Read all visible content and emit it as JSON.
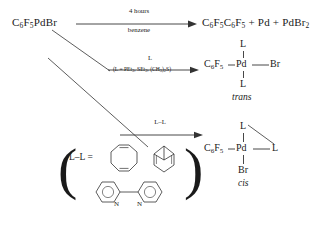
{
  "scheme": {
    "title": "Reactions of pentafluorophenylpalladium bromide",
    "reactant": {
      "label": "C6F5PdBr",
      "parts": [
        {
          "t": "C",
          "sub": ""
        },
        {
          "t": "",
          "sub": "6"
        },
        {
          "t": "F",
          "sub": "5"
        },
        {
          "t": "PdBr",
          "sub": ""
        }
      ]
    },
    "reaction_thermal": {
      "above": "4 hours",
      "below": "benzene",
      "products": "C6F5C6F5 + Pd + PdBr2"
    },
    "reaction_monodentate": {
      "above": "L",
      "below": "(L = PEt3, SEt2, (CH3)2S)",
      "isomer": "trans",
      "center": "Pd",
      "left": "C6F5",
      "right": "Br",
      "top": "L",
      "bottom": "L"
    },
    "reaction_bidentate": {
      "above": "L–L",
      "ligand_prefix": "L–L =",
      "ligands": [
        "cycloocta-1,5-diene",
        "norbornadiene",
        "2,2'-bipyridine"
      ],
      "nitrogen_label": "N",
      "isomer": "cis",
      "center": "Pd",
      "left": "C6F5",
      "right": "L",
      "top": "L",
      "bottom": "Br"
    },
    "colors": {
      "ink": "#1a1a1a",
      "line": "#333333",
      "background": "#ffffff"
    }
  }
}
